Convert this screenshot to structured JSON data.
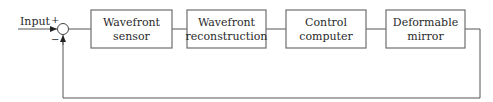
{
  "diagram": {
    "input_label": "Input",
    "summing_junction": {
      "plus_sign": "+",
      "minus_sign": "−"
    },
    "blocks": [
      {
        "line1": "Wavefront",
        "line2": "sensor"
      },
      {
        "line1": "Wavefront",
        "line2": "reconstruction"
      },
      {
        "line1": "Control",
        "line2": "computer"
      },
      {
        "line1": "Deformable",
        "line2": "mirror"
      }
    ],
    "colors": {
      "stroke": "#555555",
      "text": "#2a2a2a",
      "background": "#ffffff"
    }
  }
}
